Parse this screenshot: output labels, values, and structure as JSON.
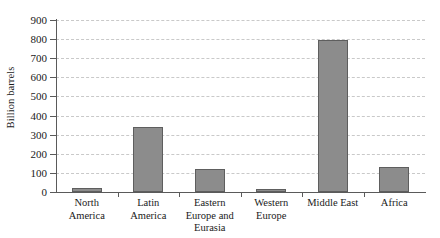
{
  "chart_data": {
    "type": "bar",
    "title": "",
    "xlabel": "",
    "ylabel": "Billion barrels",
    "categories": [
      "North America",
      "Latin America",
      "Eastern Europe and Eurasia",
      "Western Europe",
      "Middle East",
      "Africa"
    ],
    "category_labels": [
      "North\nAmerica",
      "Latin\nAmerica",
      "Eastern\nEurope and\nEurasia",
      "Western\nEurope",
      "Middle East",
      "Africa"
    ],
    "values": [
      21,
      340,
      120,
      14,
      795,
      130
    ],
    "ylim": [
      0,
      900
    ],
    "ytick_values": [
      0,
      100,
      200,
      300,
      400,
      500,
      600,
      700,
      800,
      900
    ],
    "ytick_labels": [
      "0",
      "100",
      "200",
      "300",
      "400",
      "500",
      "600",
      "700",
      "800",
      "900"
    ],
    "grid": true,
    "legend": null,
    "bar_color": "#8c8c8c",
    "bar_border_color": "#5e5e5e",
    "axis_color": "#5a5a5a",
    "gridline_color": "#c9c9c9",
    "background_color": "#ffffff"
  }
}
